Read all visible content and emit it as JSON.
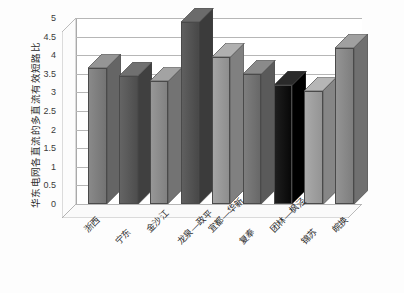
{
  "chart_data": {
    "type": "bar",
    "title": "",
    "xlabel": "",
    "ylabel": "华东电网各直流的多直流有效短路比",
    "categories": [
      "浙西",
      "宁东",
      "金沙江",
      "龙泉—政平",
      "宜都—华新",
      "复奉",
      "团林—枫泾",
      "锦苏",
      "皖换"
    ],
    "values": [
      3.65,
      3.45,
      3.3,
      4.9,
      3.95,
      3.5,
      3.2,
      3.05,
      4.2
    ],
    "ylim": [
      0,
      5
    ],
    "ytick_labels": [
      "5",
      "4.5",
      "4",
      "3.5",
      "3",
      "2.5",
      "2",
      "1.5",
      "1",
      "0.5",
      "0"
    ],
    "ytick_values": [
      5,
      4.5,
      4,
      3.5,
      3,
      2.5,
      2,
      1.5,
      1,
      0.5,
      0
    ],
    "grid": true,
    "legend": "none",
    "style": "3d-column",
    "bar_colors": [
      "#7f7f7f",
      "#5a5a5a",
      "#8d8d8d",
      "#555555",
      "#9a9a9a",
      "#747474",
      "#141414",
      "#a0a0a0",
      "#8a8a8a"
    ]
  },
  "axes": {
    "plot_background": "#ffffff",
    "gridline_color": "#b6b6b6",
    "axis_color": "#a9a9a9"
  }
}
